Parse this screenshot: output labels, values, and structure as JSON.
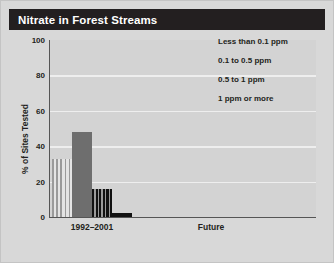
{
  "figure": {
    "title": "Nitrate in Forest Streams",
    "background_color": "#d8d8d8",
    "title_bar_color": "#231f20",
    "plot_background_color": "#d3d3d3",
    "gridline_color": "#eeeeee",
    "axis_color": "#555555"
  },
  "chart_data": {
    "type": "bar",
    "title": "Nitrate in Forest Streams",
    "xlabel": "",
    "ylabel": "% of Sites Tested",
    "ylim": [
      0,
      100
    ],
    "yticks": [
      0,
      20,
      40,
      60,
      80,
      100
    ],
    "ytick_labels": [
      "0",
      "20",
      "40",
      "60",
      "80",
      "100"
    ],
    "categories": [
      "1992–2001",
      "Future"
    ],
    "grid": true,
    "grid_axis": "y",
    "legend_position": "upper right",
    "series": [
      {
        "name": "Less than 0.1 ppm",
        "pattern": "light-vertical-stripe",
        "color": "#cfcfcf",
        "values": [
          33,
          0
        ]
      },
      {
        "name": "0.1 to 0.5 ppm",
        "pattern": "solid-gray",
        "color": "#6e6e6e",
        "values": [
          48,
          0
        ]
      },
      {
        "name": "0.5 to 1 ppm",
        "pattern": "dark-vertical-stripe",
        "color": "#1c1c1c",
        "values": [
          16,
          0
        ]
      },
      {
        "name": "1 ppm or more",
        "pattern": "solid-black",
        "color": "#121212",
        "values": [
          2,
          0
        ]
      }
    ]
  },
  "legend": {
    "items": [
      {
        "label": "Less than 0.1 ppm",
        "pattern": "light-vertical-stripe"
      },
      {
        "label": "0.1 to 0.5 ppm",
        "pattern": "solid-gray"
      },
      {
        "label": "0.5 to 1 ppm",
        "pattern": "dark-vertical-stripe"
      },
      {
        "label": "1 ppm or more",
        "pattern": "solid-black"
      }
    ]
  },
  "axes": {
    "y_title": "% of Sites Tested",
    "y_tick_labels": [
      "100",
      "80",
      "60",
      "40",
      "20",
      "0"
    ],
    "x_tick_labels": [
      "1992–2001",
      "Future"
    ]
  }
}
